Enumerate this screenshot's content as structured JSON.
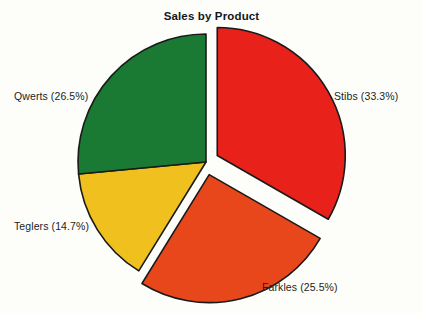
{
  "chart": {
    "title": "Sales by Product",
    "background_color": "#fdfdfa",
    "outline_color": "#1a1a1a"
  },
  "chart_data": {
    "type": "pie",
    "title": "Sales by Product",
    "xlabel": "",
    "ylabel": "",
    "legend_position": "none",
    "grid": false,
    "labels_show_percent": true,
    "categories": [
      "Stibs",
      "Farkles",
      "Teglers",
      "Qwerts"
    ],
    "values": [
      33.3,
      25.5,
      14.7,
      26.5
    ],
    "colors": [
      "#e8211b",
      "#e8471c",
      "#f0c01e",
      "#1a7a33"
    ],
    "exploded": [
      true,
      true,
      false,
      false
    ],
    "slices": [
      {
        "name": "Stibs",
        "value": 33.3,
        "label": "Stibs (33.3%)",
        "color": "#e8211b",
        "color_name": "red",
        "exploded": true,
        "label_position": "right"
      },
      {
        "name": "Farkles",
        "value": 25.5,
        "label": "Farkles (25.5%)",
        "color": "#e8471c",
        "color_name": "orange",
        "exploded": true,
        "label_position": "bottom-right"
      },
      {
        "name": "Teglers",
        "value": 14.7,
        "label": "Teglers (14.7%)",
        "color": "#f0c01e",
        "color_name": "yellow",
        "exploded": false,
        "label_position": "bottom-left"
      },
      {
        "name": "Qwerts",
        "value": 26.5,
        "label": "Qwerts (26.5%)",
        "color": "#1a7a33",
        "color_name": "green",
        "exploded": false,
        "label_position": "left"
      }
    ]
  }
}
